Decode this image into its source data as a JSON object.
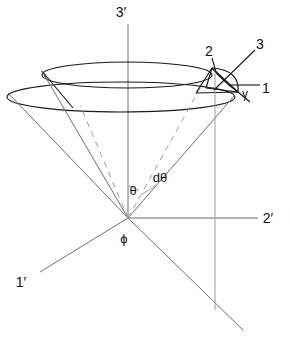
{
  "figure": {
    "background_color": "#ffffff",
    "stroke_color": "#1a1a1a",
    "faint_stroke_color": "#8a8a8a",
    "dashed_stroke_color": "#9a9a9a"
  },
  "axes": [
    {
      "id": "axis-3p",
      "label": "3′",
      "label_x": 121,
      "label_y": 17,
      "description": "vertical axis upward from origin"
    },
    {
      "id": "axis-2p",
      "label": "2′",
      "label_x": 268,
      "label_y": 219,
      "description": "horizontal axis to the right of origin"
    },
    {
      "id": "axis-1p",
      "label": "1′",
      "label_x": 21,
      "label_y": 283,
      "description": "axis toward lower left / out of page"
    }
  ],
  "angles": [
    {
      "id": "angle-theta",
      "label": "θ",
      "label_x": 133,
      "label_y": 191,
      "description": "polar angle from 3' axis to cone surface"
    },
    {
      "id": "angle-dtheta",
      "label": "dθ",
      "label_x": 157,
      "label_y": 178,
      "description": "differential polar angle thickness of the cone band"
    },
    {
      "id": "angle-phi",
      "label": "ϕ",
      "label_x": 123,
      "label_y": 239,
      "description": "azimuthal angle at the origin"
    },
    {
      "id": "angle-gamma",
      "label": "γ",
      "label_x": 245,
      "label_y": 95,
      "description": "angle at the differential surface patch"
    }
  ],
  "callouts": [
    {
      "id": "callout-1",
      "label": "1",
      "label_x": 265,
      "label_y": 89,
      "description": "leader to right vertex of differential patch"
    },
    {
      "id": "callout-2",
      "label": "2",
      "label_x": 209,
      "label_y": 53,
      "description": "leader to upper vertex of differential patch"
    },
    {
      "id": "callout-3",
      "label": "3",
      "label_x": 259,
      "label_y": 46,
      "description": "leader to centre of differential patch"
    }
  ],
  "geometry": {
    "origin": {
      "x": 128,
      "y": 218
    },
    "upper_ellipse": {
      "cx": 127,
      "cy": 75,
      "rx": 85,
      "ry": 13
    },
    "lower_ellipse": {
      "cx": 121,
      "cy": 97,
      "rx": 114,
      "ry": 15
    },
    "patch": {
      "cx": 224,
      "cy": 78,
      "rx": 14,
      "ry": 16
    },
    "drop_line_x": 215,
    "drop_line_y0": 78,
    "drop_line_y1": 310
  }
}
